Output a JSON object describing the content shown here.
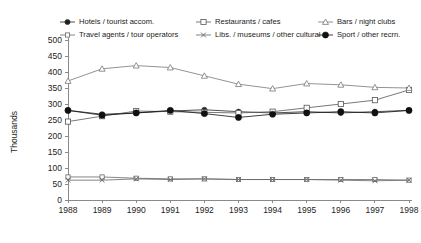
{
  "chart_data": {
    "type": "line",
    "title": "",
    "xlabel": "",
    "ylabel": "Thousands",
    "x": [
      1988,
      1989,
      1990,
      1991,
      1992,
      1993,
      1994,
      1995,
      1996,
      1997,
      1998
    ],
    "x_tick_labels": [
      "1988",
      "1989",
      "1990",
      "1991",
      "1992",
      "1993",
      "1994",
      "1995",
      "1996",
      "1997",
      "1998"
    ],
    "y_tick_labels": [
      "0",
      "50",
      "100",
      "150",
      "200",
      "250",
      "300",
      "350",
      "400",
      "450",
      "500"
    ],
    "ylim": [
      0,
      500
    ],
    "y_tick_step": 50,
    "grid": false,
    "legend_position": "top",
    "series": [
      {
        "name": "Hotels / tourist accom.",
        "marker": "filled-circle",
        "color": "#222222",
        "values": [
          280,
          268,
          272,
          278,
          282,
          276,
          272,
          276,
          272,
          276,
          280
        ]
      },
      {
        "name": "Restaurants / cafes",
        "marker": "open-square",
        "color": "#555555",
        "values": [
          245,
          262,
          278,
          276,
          274,
          272,
          276,
          288,
          300,
          312,
          344
        ]
      },
      {
        "name": "Bars / night clubs",
        "marker": "open-triangle",
        "color": "#777777",
        "values": [
          372,
          410,
          420,
          414,
          388,
          362,
          348,
          364,
          360,
          352,
          350
        ]
      },
      {
        "name": "Travel agents / tour operators",
        "marker": "open-square-small",
        "color": "#666666",
        "values": [
          72,
          72,
          68,
          66,
          66,
          64,
          64,
          64,
          64,
          64,
          62
        ]
      },
      {
        "name": "Libs. / museums / other cultural",
        "marker": "cross-x",
        "color": "#666666",
        "values": [
          62,
          62,
          66,
          64,
          66,
          64,
          64,
          64,
          62,
          60,
          62
        ]
      },
      {
        "name": "Sport / other recrn.",
        "marker": "filled-circle-bold",
        "color": "#111111",
        "values": [
          280,
          265,
          272,
          280,
          270,
          258,
          268,
          272,
          276,
          272,
          280
        ]
      }
    ]
  },
  "legend": {
    "items": [
      {
        "label": "Hotels / tourist accom.",
        "marker": "filled-circle"
      },
      {
        "label": "Restaurants / cafes",
        "marker": "open-square"
      },
      {
        "label": "Bars / night clubs",
        "marker": "open-triangle"
      },
      {
        "label": "Travel agents / tour operators",
        "marker": "open-square-small"
      },
      {
        "label": "Libs. / museums / other cultural",
        "marker": "cross-x"
      },
      {
        "label": "Sport / other recrn.",
        "marker": "filled-circle-bold"
      }
    ]
  }
}
